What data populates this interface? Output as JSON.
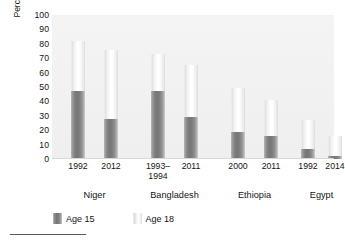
{
  "chart_data": {
    "type": "bar",
    "subtype": "stacked-vertical",
    "title": "",
    "xlabel": "",
    "ylabel": "Percent of young women married by age",
    "ylabel_lines": [
      "Percent of young women",
      "married by age"
    ],
    "ylim": [
      0,
      100
    ],
    "yticks": [
      100,
      90,
      80,
      70,
      60,
      50,
      40,
      30,
      20,
      10,
      0
    ],
    "grid": false,
    "legend_position": "bottom-left",
    "legend": [
      {
        "name": "Age 15",
        "color": "#7c7c7c"
      },
      {
        "name": "Age 18",
        "color": "#f5f5f5"
      }
    ],
    "series": [
      {
        "name": "Age 15",
        "values": [
          47,
          28,
          47,
          29,
          19,
          16,
          7,
          2
        ]
      },
      {
        "name": "Age 18",
        "values": [
          82,
          76,
          73,
          65,
          49,
          41,
          27,
          16
        ]
      }
    ],
    "categories": [
      "1992",
      "2012",
      "1993–\n1994",
      "2011",
      "2000",
      "2011",
      "1992",
      "2014"
    ],
    "groups": [
      {
        "label": "Niger",
        "categories": [
          "1992",
          "2012"
        ]
      },
      {
        "label": "Bangladesh",
        "categories": [
          "1993–\n1994",
          "2011"
        ]
      },
      {
        "label": "Ethiopia",
        "categories": [
          "2000",
          "2011"
        ]
      },
      {
        "label": "Egypt",
        "categories": [
          "1992",
          "2014"
        ]
      }
    ],
    "bars": [
      {
        "group": "Niger",
        "year": "1992",
        "age15": 47,
        "age18": 82
      },
      {
        "group": "Niger",
        "year": "2012",
        "age15": 28,
        "age18": 76
      },
      {
        "group": "Bangladesh",
        "year": "1993–\n1994",
        "age15": 47,
        "age18": 73
      },
      {
        "group": "Bangladesh",
        "year": "2011",
        "age15": 29,
        "age18": 65
      },
      {
        "group": "Ethiopia",
        "year": "2000",
        "age15": 19,
        "age18": 49
      },
      {
        "group": "Ethiopia",
        "year": "2011",
        "age15": 16,
        "age18": 41
      },
      {
        "group": "Egypt",
        "year": "1992",
        "age15": 7,
        "age18": 27
      },
      {
        "group": "Egypt",
        "year": "2014",
        "age15": 2,
        "age18": 16
      }
    ]
  },
  "axis": {
    "ytick_labels": [
      "100",
      "90",
      "80",
      "70",
      "60",
      "50",
      "40",
      "30",
      "20",
      "10",
      "0"
    ]
  }
}
